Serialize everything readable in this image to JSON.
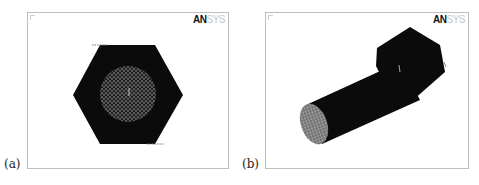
{
  "panels": [
    {
      "id": "a",
      "caption": "(a)",
      "logo": {
        "bold": "AN",
        "light": "SYS"
      },
      "view": "hexagonal nut cross-section mesh (top view)",
      "colors": {
        "solid": "#0a0a0a",
        "mesh": "#8a8a8a",
        "background": "#ffffff",
        "frame": "#bdbdbd"
      }
    },
    {
      "id": "b",
      "caption": "(b)",
      "logo": {
        "bold": "AN",
        "light": "SYS"
      },
      "view": "bolt mesh isometric view",
      "colors": {
        "solid": "#0a0a0a",
        "mesh": "#9a9a9a",
        "background": "#ffffff",
        "frame": "#bdbdbd"
      }
    }
  ]
}
